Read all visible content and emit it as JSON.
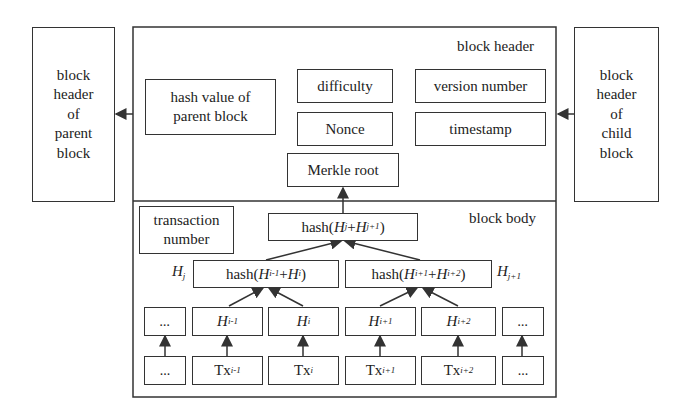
{
  "parent_block": {
    "label": "block header of parent block",
    "lines": [
      "block",
      "header",
      "of",
      "parent",
      "block"
    ]
  },
  "child_block": {
    "label": "block header of child block",
    "lines": [
      "block",
      "header",
      "of",
      "child",
      "block"
    ]
  },
  "header": {
    "title": "block header",
    "hash_parent": [
      "hash value of",
      "parent block"
    ],
    "difficulty": "difficulty",
    "version": "version number",
    "nonce": "Nonce",
    "timestamp": "timestamp",
    "merkle_root": "Merkle root"
  },
  "body": {
    "title": "block body",
    "tx_number": [
      "transaction",
      "number"
    ],
    "root_hash": {
      "pre": "hash(",
      "a": "H",
      "a_sub": "j",
      "plus": "+",
      "b": "H",
      "b_sub": "j+1",
      "post": ")"
    },
    "left_hash": {
      "pre": "hash(",
      "a": "H",
      "a_sub": "i-1",
      "plus": "+",
      "b": "H",
      "b_sub": "i",
      "post": ")"
    },
    "right_hash": {
      "pre": "hash(",
      "a": "H",
      "a_sub": "i+1",
      "plus": "+",
      "b": "H",
      "b_sub": "i+2",
      "post": ")"
    },
    "left_tag": {
      "h": "H",
      "sub": "j"
    },
    "right_tag": {
      "h": "H",
      "sub": "j+1"
    },
    "hashes": [
      {
        "h": "...",
        "sub": ""
      },
      {
        "h": "H",
        "sub": "i-1"
      },
      {
        "h": "H",
        "sub": "i"
      },
      {
        "h": "H",
        "sub": "i+1"
      },
      {
        "h": "H",
        "sub": "i+2"
      },
      {
        "h": "...",
        "sub": ""
      }
    ],
    "txs": [
      {
        "t": "...",
        "sub": ""
      },
      {
        "t": "Tx",
        "sub": "i-1"
      },
      {
        "t": "Tx",
        "sub": "i"
      },
      {
        "t": "Tx",
        "sub": "i+1"
      },
      {
        "t": "Tx",
        "sub": "i+2"
      },
      {
        "t": "...",
        "sub": ""
      }
    ]
  }
}
